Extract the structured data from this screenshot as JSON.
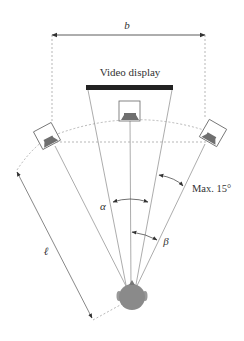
{
  "diagram": {
    "labels": {
      "width": "b",
      "display": "Video display",
      "distance": "ℓ",
      "alpha": "α",
      "beta": "β",
      "max_angle": "Max. 15°"
    },
    "elements": {
      "speakers": [
        "left-speaker",
        "center-speaker",
        "right-speaker"
      ],
      "listener": "listener-head",
      "screen": "video-display"
    },
    "colors": {
      "line": "#777777",
      "screen": "#222222",
      "speaker_fill": "#6f6f6f",
      "head_fill": "#8a8a8a"
    }
  }
}
